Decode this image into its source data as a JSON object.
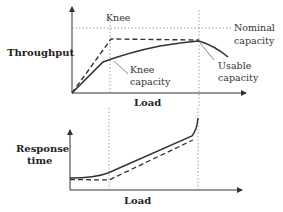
{
  "diagram": {
    "top_panel": {
      "y_label": "Throughput",
      "x_label": "Load",
      "annotations": {
        "knee": "Knee",
        "nominal_line1": "Nominal",
        "nominal_line2": "capacity",
        "knee_cap_line1": "Knee",
        "knee_cap_line2": "capacity",
        "usable_line1": "Usable",
        "usable_line2": "capacity"
      },
      "curves": [
        {
          "name": "ideal",
          "style": "dashed"
        },
        {
          "name": "actual",
          "style": "solid"
        }
      ]
    },
    "bottom_panel": {
      "y_label_line1": "Response",
      "y_label_line2": "time",
      "x_label": "Load",
      "curves": [
        {
          "name": "actual",
          "style": "solid"
        },
        {
          "name": "ideal",
          "style": "dashed"
        }
      ]
    },
    "colors": {
      "line": "#333333",
      "guide": "#777777",
      "background": "#ffffff"
    }
  }
}
